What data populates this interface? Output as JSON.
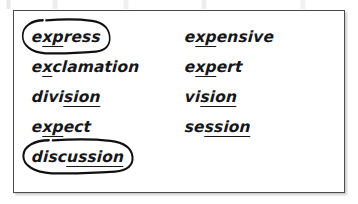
{
  "document": {
    "type": "worksheet-word-list",
    "background_color": "#ffffff",
    "box_border_color": "#4a4a4f",
    "ink_color": "#17171a",
    "annotation_color": "#111114"
  },
  "word_list": {
    "columns": [
      {
        "name": "left-column",
        "entries": [
          {
            "word": "express",
            "parts": [
              {
                "text": "e",
                "underlined": false
              },
              {
                "text": "xp",
                "underlined": true
              },
              {
                "text": "ress",
                "underlined": false
              }
            ],
            "circled": true
          },
          {
            "word": "exclamation",
            "parts": [
              {
                "text": "e",
                "underlined": false
              },
              {
                "text": "x",
                "underlined": true
              },
              {
                "text": "clamation",
                "underlined": false
              }
            ],
            "circled": false
          },
          {
            "word": "division",
            "parts": [
              {
                "text": "divi",
                "underlined": false
              },
              {
                "text": "sion",
                "underlined": true
              }
            ],
            "circled": false
          },
          {
            "word": "expect",
            "parts": [
              {
                "text": "e",
                "underlined": false
              },
              {
                "text": "xp",
                "underlined": true
              },
              {
                "text": "ect",
                "underlined": false
              }
            ],
            "circled": false
          },
          {
            "word": "discussion",
            "parts": [
              {
                "text": "disc",
                "underlined": false
              },
              {
                "text": "ussion",
                "underlined": true
              }
            ],
            "circled": true
          }
        ]
      },
      {
        "name": "right-column",
        "entries": [
          {
            "word": "expensive",
            "parts": [
              {
                "text": "e",
                "underlined": false
              },
              {
                "text": "xp",
                "underlined": true
              },
              {
                "text": "ensive",
                "underlined": false
              }
            ],
            "circled": false
          },
          {
            "word": "expert",
            "parts": [
              {
                "text": "e",
                "underlined": false
              },
              {
                "text": "xp",
                "underlined": true
              },
              {
                "text": "ert",
                "underlined": false
              }
            ],
            "circled": false
          },
          {
            "word": "vision",
            "parts": [
              {
                "text": "vi",
                "underlined": false
              },
              {
                "text": "sion",
                "underlined": true
              }
            ],
            "circled": false
          },
          {
            "word": "session",
            "parts": [
              {
                "text": "se",
                "underlined": false
              },
              {
                "text": "ssion",
                "underlined": true
              }
            ],
            "circled": false
          }
        ]
      }
    ]
  }
}
